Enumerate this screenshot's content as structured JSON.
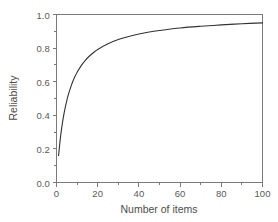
{
  "chart_data": {
    "type": "line",
    "title": "",
    "xlabel": "Number of items",
    "ylabel": "Reliability",
    "xlim": [
      0,
      100
    ],
    "ylim": [
      0.0,
      1.0
    ],
    "grid": false,
    "legend": "none",
    "x_ticks": [
      "0",
      "20",
      "40",
      "60",
      "80",
      "100"
    ],
    "x_tick_values": [
      0,
      20,
      40,
      60,
      80,
      100
    ],
    "y_ticks": [
      "0.0",
      "0.2",
      "0.4",
      "0.6",
      "0.8",
      "1.0"
    ],
    "y_tick_values": [
      0.0,
      0.2,
      0.4,
      0.6,
      0.8,
      1.0
    ],
    "x_minor_ticks": [
      10,
      30,
      50,
      70,
      90
    ],
    "y_minor_ticks": [
      0.1,
      0.3,
      0.5,
      0.7,
      0.9
    ],
    "series": [
      {
        "name": "Spearman-Brown reliability",
        "color": "#333333",
        "x": [
          1,
          2,
          3,
          4,
          5,
          6,
          7,
          8,
          9,
          10,
          12,
          14,
          16,
          18,
          20,
          25,
          30,
          35,
          40,
          45,
          50,
          60,
          70,
          80,
          90,
          100
        ],
        "values": [
          0.16,
          0.276,
          0.364,
          0.432,
          0.488,
          0.533,
          0.571,
          0.604,
          0.632,
          0.656,
          0.696,
          0.727,
          0.753,
          0.774,
          0.792,
          0.826,
          0.851,
          0.869,
          0.884,
          0.896,
          0.905,
          0.92,
          0.93,
          0.938,
          0.945,
          0.95
        ]
      }
    ],
    "annotations": []
  },
  "axes": {
    "x_title": "Number of items",
    "y_title": "Reliability"
  },
  "colors": {
    "curve": "#333333",
    "axis": "#7a7a7a",
    "background": "#ffffff",
    "tick_label": "#5a5a5a"
  }
}
